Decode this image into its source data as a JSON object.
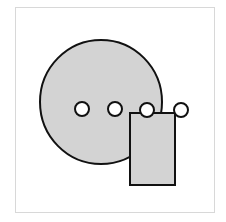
{
  "diagram": {
    "frame": {
      "x": 15,
      "y": 7,
      "width": 199,
      "height": 205,
      "stroke": "#d8d8d8",
      "fill": "#ffffff"
    },
    "shapes": {
      "big_circle": {
        "cx": 101,
        "cy": 102,
        "rx": 61,
        "ry": 62,
        "fill": "#d3d3d3",
        "stroke": "#111111"
      },
      "rectangle": {
        "x": 130,
        "y": 113,
        "width": 45,
        "height": 72,
        "fill": "#d3d3d3",
        "stroke": "#111111"
      },
      "small_circles": [
        {
          "cx": 82,
          "cy": 109,
          "r": 7
        },
        {
          "cx": 115,
          "cy": 109,
          "r": 7
        },
        {
          "cx": 147,
          "cy": 110,
          "r": 7
        },
        {
          "cx": 181,
          "cy": 110,
          "r": 7
        }
      ],
      "small_circle_fill": "#ffffff",
      "small_circle_stroke": "#111111"
    }
  }
}
